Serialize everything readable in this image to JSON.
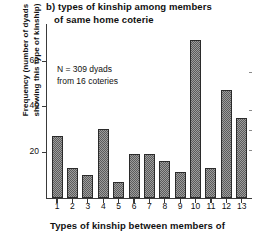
{
  "chart_data": {
    "type": "bar",
    "title": "b) types of kinship among members of same home coterie",
    "title_lines": [
      "b) types of kinship among members",
      "of same home coterie"
    ],
    "xlabel": "Types of kinship between members of",
    "ylabel": "Frequency (number of dyads showing this type of kinship)",
    "ylabel_lines": [
      "Frequency (number of dyads",
      "showing this type of kinship)"
    ],
    "categories": [
      "1",
      "2",
      "3",
      "4",
      "5",
      "6",
      "7",
      "8",
      "9",
      "10",
      "11",
      "12",
      "13"
    ],
    "values": [
      27,
      13,
      10,
      30,
      7,
      19,
      19,
      16,
      11,
      69,
      13,
      47,
      35
    ],
    "ylim": [
      0,
      76
    ],
    "yticks": [
      20,
      40,
      60
    ],
    "ytick_labels": [
      "20",
      "40",
      "60"
    ],
    "grid": false,
    "legend": null,
    "annotation_lines": [
      "N = 309 dyads",
      "from 16 coteries"
    ],
    "bar_fill": "#9d9d9d",
    "bar_edge": "#2b2b2b",
    "axis_color": "#3a3a3a"
  }
}
